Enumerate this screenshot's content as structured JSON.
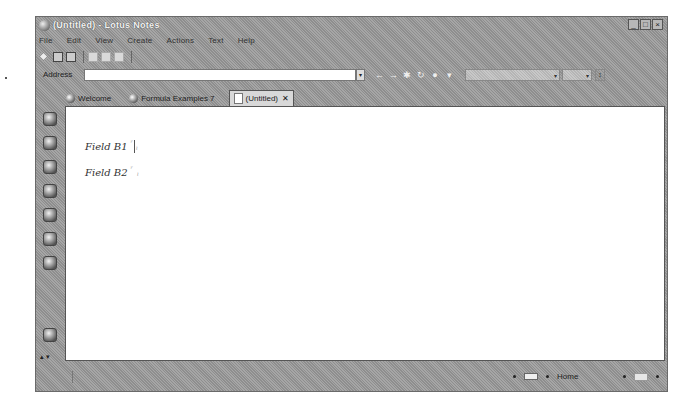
{
  "window": {
    "title": "(Untitled) - Lotus Notes",
    "controls": {
      "minimize": "_",
      "maximize": "□",
      "close": "×"
    }
  },
  "menubar": {
    "items": [
      "File",
      "Edit",
      "View",
      "Create",
      "Actions",
      "Text",
      "Help"
    ]
  },
  "toolbar": {
    "icons": [
      "bookmark-icon",
      "save-icon",
      "print-icon",
      "cut-icon",
      "copy-icon",
      "paste-icon"
    ]
  },
  "addressbar": {
    "label": "Address",
    "value": "",
    "dropdown_arrow": "▾",
    "nav": {
      "back": "←",
      "forward": "→",
      "stop": "✱",
      "refresh": "↻",
      "home": "●",
      "more": "▾"
    },
    "search_value": "",
    "search_go": "↕"
  },
  "tabs": [
    {
      "label": "Welcome",
      "icon": "globe-icon",
      "active": false
    },
    {
      "label": "Formula Examples 7",
      "icon": "database-icon",
      "active": false
    },
    {
      "label": "(Untitled)",
      "icon": "document-icon",
      "active": true,
      "close": "✕"
    }
  ],
  "sidebar": {
    "icons": [
      "mail-icon",
      "calendar-icon",
      "address-book-icon",
      "todo-icon",
      "replicator-icon",
      "sametime-icon",
      "workspace-icon",
      "database-icon"
    ],
    "scroll": "▴ ▾"
  },
  "document": {
    "fields": [
      {
        "label": "Field B1",
        "open": "ʳ",
        "close": "ˡ"
      },
      {
        "label": "Field B2",
        "open": "ʳ",
        "close": "ˡ"
      }
    ]
  },
  "statusbar": {
    "location": "Home",
    "left_text": ""
  }
}
